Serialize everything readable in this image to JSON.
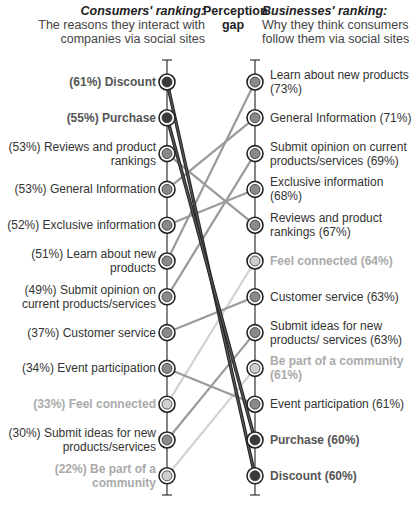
{
  "headers": {
    "left_title": "Consumers' ranking:",
    "left_sub": "The reasons they interact with companies via social sites",
    "mid_title": "Perception gap",
    "right_title": "Businesses' ranking:",
    "right_sub": "Why they think consumers follow them via social sites"
  },
  "colors": {
    "dark": "#3a3a3a",
    "mid": "#8a8a8a",
    "light": "#cfcfcf"
  },
  "left": [
    {
      "label": "(61%) Discount",
      "tone": "dark"
    },
    {
      "label": "(55%) Purchase",
      "tone": "dark"
    },
    {
      "label": "(53%) Reviews and product rankings",
      "tone": "mid"
    },
    {
      "label": "(53%) General Information",
      "tone": "mid"
    },
    {
      "label": "(52%) Exclusive information",
      "tone": "mid"
    },
    {
      "label": "(51%) Learn about new products",
      "tone": "mid"
    },
    {
      "label": "(49%) Submit opinion on current products/services",
      "tone": "mid"
    },
    {
      "label": "(37%) Customer service",
      "tone": "mid"
    },
    {
      "label": "(34%) Event participation",
      "tone": "mid"
    },
    {
      "label": "(33%) Feel connected",
      "tone": "light"
    },
    {
      "label": "(30%) Submit ideas for new products/services",
      "tone": "mid"
    },
    {
      "label": "(22%) Be part of a community",
      "tone": "light"
    }
  ],
  "right": [
    {
      "label": "Learn about new products (73%)",
      "tone": "mid"
    },
    {
      "label": "General Information (71%)",
      "tone": "mid"
    },
    {
      "label": "Submit opinion on current products/services (69%)",
      "tone": "mid"
    },
    {
      "label": "Exclusive information (68%)",
      "tone": "mid"
    },
    {
      "label": "Reviews and product rankings (67%)",
      "tone": "mid"
    },
    {
      "label": "Feel connected (64%)",
      "tone": "light"
    },
    {
      "label": "Customer service (63%)",
      "tone": "mid"
    },
    {
      "label": "Submit ideas for new products/ services (63%)",
      "tone": "mid"
    },
    {
      "label": "Be part of a community (61%)",
      "tone": "light"
    },
    {
      "label": "Event participation (61%)",
      "tone": "mid"
    },
    {
      "label": "Purchase (60%)",
      "tone": "dark"
    },
    {
      "label": "Discount (60%)",
      "tone": "dark"
    }
  ],
  "chart_data": {
    "type": "slope",
    "title": "Perception gap",
    "left_axis": "Consumers' ranking: The reasons they interact with companies via social sites",
    "right_axis": "Businesses' ranking: Why they think consumers follow them via social sites",
    "series": [
      {
        "name": "Discount",
        "consumers": 61,
        "businesses": 60
      },
      {
        "name": "Purchase",
        "consumers": 55,
        "businesses": 60
      },
      {
        "name": "Reviews and product rankings",
        "consumers": 53,
        "businesses": 67
      },
      {
        "name": "General Information",
        "consumers": 53,
        "businesses": 71
      },
      {
        "name": "Exclusive information",
        "consumers": 52,
        "businesses": 68
      },
      {
        "name": "Learn about new products",
        "consumers": 51,
        "businesses": 73
      },
      {
        "name": "Submit opinion on current products/services",
        "consumers": 49,
        "businesses": 69
      },
      {
        "name": "Customer service",
        "consumers": 37,
        "businesses": 63
      },
      {
        "name": "Event participation",
        "consumers": 34,
        "businesses": 61
      },
      {
        "name": "Feel connected",
        "consumers": 33,
        "businesses": 64
      },
      {
        "name": "Submit ideas for new products/services",
        "consumers": 30,
        "businesses": 63
      },
      {
        "name": "Be part of a community",
        "consumers": 22,
        "businesses": 61
      }
    ],
    "links": [
      [
        0,
        11
      ],
      [
        1,
        10
      ],
      [
        2,
        4
      ],
      [
        3,
        1
      ],
      [
        4,
        3
      ],
      [
        5,
        0
      ],
      [
        6,
        2
      ],
      [
        7,
        6
      ],
      [
        8,
        9
      ],
      [
        9,
        5
      ],
      [
        10,
        7
      ],
      [
        11,
        8
      ]
    ]
  }
}
